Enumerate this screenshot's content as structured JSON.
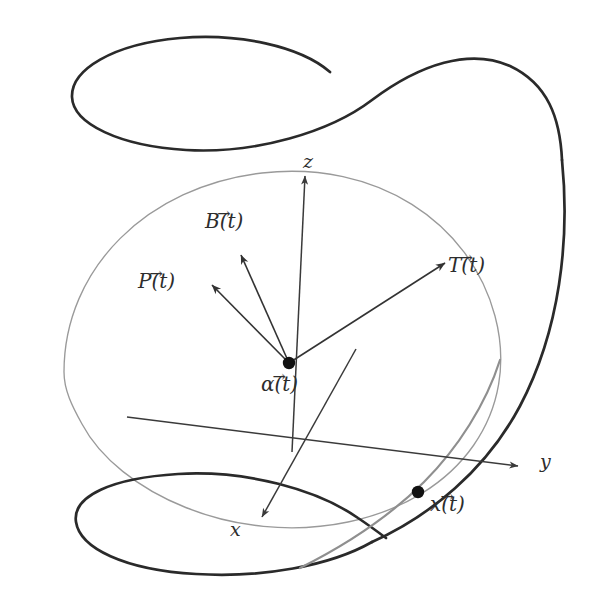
{
  "figure": {
    "background_color": "#ffffff",
    "width": 590,
    "height": 608
  },
  "colors": {
    "helix_dark": "#2a2a2a",
    "plane_ellipse_gray": "#9a9a9a",
    "axis": "#3a3a3a",
    "vector": "#333333",
    "point": "#111111",
    "label": "#2d2d2d"
  },
  "axes": {
    "z": {
      "label": "z",
      "arrow_head": [
        305,
        168
      ],
      "origin": [
        292,
        445
      ]
    },
    "y": {
      "label": "y",
      "arrow_head": [
        528,
        466
      ],
      "origin": [
        292,
        445
      ]
    },
    "x": {
      "label": "x",
      "arrow_head": [
        258,
        523
      ],
      "origin": [
        292,
        445
      ]
    }
  },
  "points": [
    {
      "id": "alpha",
      "label": "α(t)",
      "label_overline": "→",
      "x": 289,
      "y": 363
    },
    {
      "id": "x_of_t",
      "label": "x(t)",
      "label_overline": "→",
      "x": 418,
      "y": 492
    }
  ],
  "vectors": [
    {
      "id": "T",
      "label": "T(t)",
      "label_overline": "→",
      "from": [
        289,
        363
      ],
      "to": [
        451,
        259
      ],
      "label_pos": [
        456,
        270
      ]
    },
    {
      "id": "B",
      "label": "B(t)",
      "label_overline": "→",
      "from": [
        289,
        363
      ],
      "to": [
        237,
        247
      ],
      "label_pos": [
        211,
        228
      ]
    },
    {
      "id": "P",
      "label": "P(t)",
      "label_overline": "→",
      "from": [
        289,
        363
      ],
      "to": [
        205,
        281
      ],
      "label_pos": [
        141,
        295
      ]
    }
  ],
  "curves": {
    "helix": {
      "id": "helix-curve",
      "description": "dark helix with upper loop and lower loop",
      "stroke": "#2a2a2a",
      "stroke_width": 2.6
    },
    "plane_ellipse": {
      "id": "plane-ellipse",
      "description": "thin gray ellipse through origin plane",
      "stroke": "#9a9a9a",
      "stroke_width": 1.3
    }
  },
  "labels": {
    "z_axis": "z",
    "y_axis": "y",
    "x_axis": "x",
    "alpha": "α(t)",
    "x_point": "x(t)",
    "T_vector": "T(t)",
    "B_vector": "B(t)",
    "P_vector": "P(t)",
    "arrow_accent": "→"
  }
}
